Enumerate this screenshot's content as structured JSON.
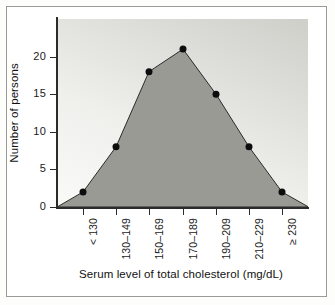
{
  "chart_data": {
    "type": "area",
    "title": "",
    "xlabel": "Serum level of total cholesterol (mg/dL)",
    "ylabel": "Number of persons",
    "categories": [
      "< 130",
      "130–149",
      "150–169",
      "170–189",
      "190–209",
      "210–229",
      "≥ 230"
    ],
    "values": [
      2,
      8,
      18,
      21,
      15,
      8,
      2
    ],
    "yticks": [
      0,
      5,
      10,
      15,
      20
    ],
    "ytick_labels": [
      "0",
      "5",
      "10",
      "15",
      "20"
    ],
    "ylim": [
      0,
      25
    ],
    "grid": false,
    "legend": "none",
    "marker": "filled-circle",
    "colors": {
      "area_fill": "#9a9a95",
      "line": "#1a1a1a",
      "marker": "#0d0d0d",
      "axis": "#2b2b2b",
      "plot_bg_light": "#fafaf8",
      "plot_bg_dark": "#cfcfca",
      "page_bg": "#ffffff",
      "frame": "#9b9b96",
      "text": "#111111"
    }
  },
  "figure": {
    "y_axis_title": "Number of persons",
    "x_axis_title": "Serum level of total cholesterol (mg/dL)"
  }
}
